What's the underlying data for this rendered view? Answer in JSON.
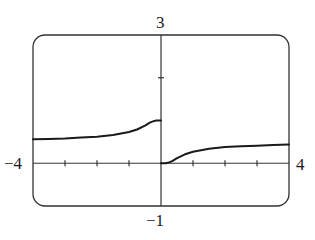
{
  "chart_data": {
    "type": "line",
    "title": "",
    "xlabel": "",
    "ylabel": "",
    "xlim": [
      -4,
      4
    ],
    "ylim": [
      -1,
      3
    ],
    "grid": false,
    "legend": null,
    "x_ticks": [
      -3,
      -2,
      -1,
      0,
      1,
      2,
      3
    ],
    "y_ticks": [
      2
    ],
    "tick_labels": {
      "xmin": "−4",
      "xmax": "4",
      "ymax": "3",
      "ymin": "−1"
    },
    "series": [
      {
        "name": "left branch (x<0)",
        "x": [
          -4,
          -3.5,
          -3,
          -2.5,
          -2,
          -1.5,
          -1,
          -0.75,
          -0.5,
          -0.35,
          -0.25,
          -0.15,
          -0.05,
          0
        ],
        "y": [
          0.56,
          0.57,
          0.58,
          0.6,
          0.62,
          0.66,
          0.73,
          0.79,
          0.88,
          0.95,
          0.98,
          1.0,
          1.0,
          1.0
        ]
      },
      {
        "name": "right branch (x>0)",
        "x": [
          0,
          0.05,
          0.15,
          0.25,
          0.35,
          0.5,
          0.75,
          1,
          1.5,
          2,
          2.5,
          3,
          3.5,
          4
        ],
        "y": [
          0,
          0.0,
          0.0,
          0.02,
          0.05,
          0.12,
          0.21,
          0.27,
          0.34,
          0.38,
          0.4,
          0.41,
          0.43,
          0.44
        ]
      }
    ],
    "colors": {
      "curve": "#1a1a1a",
      "axes": "#333333",
      "frame": "#333333"
    }
  },
  "labels": {
    "ymax": "3",
    "ymin": "−1",
    "xmin": "−4",
    "xmax": "4"
  }
}
